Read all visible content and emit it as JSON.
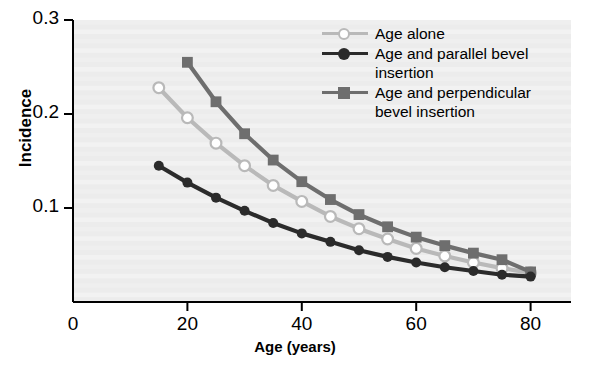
{
  "chart_data": {
    "type": "line",
    "title": "",
    "xlabel": "Age (years)",
    "ylabel": "Incidence",
    "xlim": [
      0,
      85
    ],
    "ylim": [
      0,
      0.3
    ],
    "xticks": [
      0,
      20,
      40,
      60,
      80
    ],
    "xtick_labels": [
      "0",
      "20",
      "40",
      "60",
      "80"
    ],
    "yticks": [
      0.1,
      0.2,
      0.3
    ],
    "ytick_labels": [
      "0.1",
      "0.2",
      "0.3"
    ],
    "grid": false,
    "legend_position": "top-right",
    "plot_background": "#ececec",
    "axis_color": "#000000",
    "series": [
      {
        "name": "Age alone",
        "color": "#b9b9b9",
        "marker": "open-circle",
        "marker_fill": "#ffffff",
        "x": [
          15,
          20,
          25,
          30,
          35,
          40,
          45,
          50,
          55,
          60,
          65,
          70,
          75,
          80
        ],
        "values": [
          0.228,
          0.196,
          0.169,
          0.145,
          0.124,
          0.107,
          0.091,
          0.078,
          0.067,
          0.057,
          0.049,
          0.042,
          0.036,
          0.031
        ]
      },
      {
        "name": "Age and parallel bevel\ninsertion",
        "color": "#2b2b2b",
        "marker": "filled-circle",
        "marker_fill": "#2b2b2b",
        "x": [
          15,
          20,
          25,
          30,
          35,
          40,
          45,
          50,
          55,
          60,
          65,
          70,
          75,
          80
        ],
        "values": [
          0.145,
          0.127,
          0.111,
          0.097,
          0.084,
          0.073,
          0.064,
          0.055,
          0.048,
          0.042,
          0.037,
          0.033,
          0.029,
          0.027
        ]
      },
      {
        "name": "Age and perpendicular\nbevel insertion",
        "color": "#6e6e6e",
        "marker": "filled-square",
        "marker_fill": "#6e6e6e",
        "x": [
          20,
          25,
          30,
          35,
          40,
          45,
          50,
          55,
          60,
          65,
          70,
          75,
          80
        ],
        "values": [
          0.255,
          0.213,
          0.179,
          0.151,
          0.128,
          0.109,
          0.093,
          0.08,
          0.069,
          0.06,
          0.052,
          0.045,
          0.032
        ]
      }
    ]
  },
  "axis": {
    "ylabel": "Incidence",
    "xlabel": "Age (years)"
  },
  "legend": {
    "entries": [
      {
        "label": "Age alone"
      },
      {
        "label": "Age and parallel bevel\ninsertion"
      },
      {
        "label": "Age and perpendicular\nbevel insertion"
      }
    ]
  }
}
